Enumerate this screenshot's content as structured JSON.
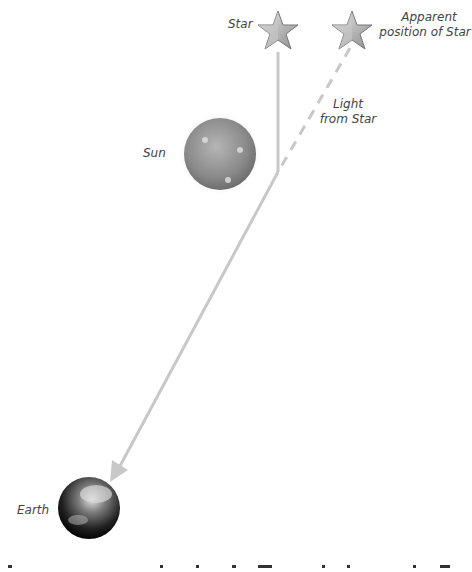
{
  "labels": {
    "star": "Star",
    "apparent_line1": "Apparent",
    "apparent_line2": "position of Star",
    "light_line1": "Light",
    "light_line2": "from Star",
    "sun": "Sun",
    "earth": "Earth"
  },
  "colors": {
    "ray": "#c8c8c8",
    "star_fill": "#b8b8b8",
    "text": "#444444"
  }
}
